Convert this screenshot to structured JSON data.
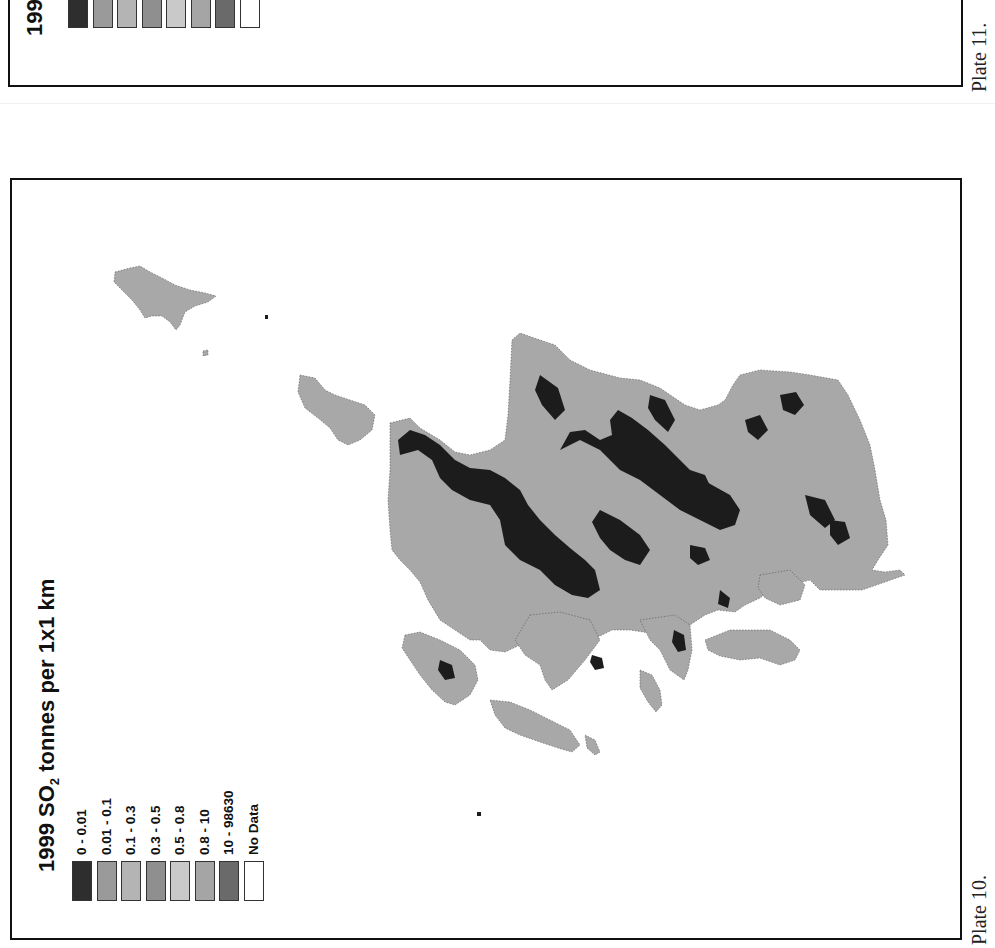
{
  "page": {
    "orientation": "rotated 90 degrees counter-clockwise",
    "plates": [
      {
        "id": "plate-11",
        "label": "Plate 11.",
        "legend_title_fragment": "199",
        "legend_colors": [
          "#2e2e2e",
          "#9a9a9a",
          "#b4b4b4",
          "#8f8f8f",
          "#c9c9c9",
          "#a5a5a5",
          "#6a6a6a",
          "#ffffff"
        ]
      },
      {
        "id": "plate-10",
        "label": "Plate 10.",
        "legend": {
          "title_prefix": "1999 SO",
          "title_subscript": "2",
          "title_suffix": " tonnes per 1x1 km",
          "classes": [
            {
              "label": "0 - 0.01",
              "color": "#2e2e2e"
            },
            {
              "label": "0.01 - 0.1",
              "color": "#9a9a9a"
            },
            {
              "label": "0.1 - 0.3",
              "color": "#b4b4b4"
            },
            {
              "label": "0.3 - 0.5",
              "color": "#8f8f8f"
            },
            {
              "label": "0.5 - 0.8",
              "color": "#c9c9c9"
            },
            {
              "label": "0.8 - 10",
              "color": "#a5a5a5"
            },
            {
              "label": "10 - 98630",
              "color": "#6a6a6a"
            },
            {
              "label": "No Data",
              "color": "#ffffff"
            }
          ]
        },
        "map": {
          "land_color": "#a8a8a8",
          "low_emission_color": "#1c1c1c",
          "water_color": "#ffffff"
        }
      }
    ]
  }
}
